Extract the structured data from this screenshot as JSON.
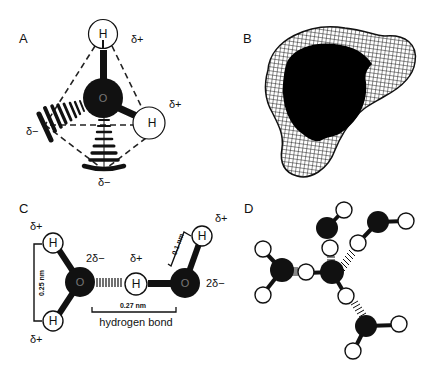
{
  "figure": {
    "panels": [
      {
        "id": "A",
        "label": "A",
        "description": "Tetrahedral water molecule with two hydrogens and two lone-pair charge lobes",
        "atoms": [
          {
            "symbol": "H",
            "role": "top-hydrogen",
            "charge": "δ+"
          },
          {
            "symbol": "O",
            "role": "oxygen"
          },
          {
            "symbol": "H",
            "role": "right-hydrogen",
            "charge": "δ+"
          }
        ],
        "lone_pairs": [
          {
            "role": "left-lone-pair",
            "charge": "δ−"
          },
          {
            "role": "bottom-lone-pair",
            "charge": "δ−"
          }
        ],
        "labels": {
          "h_top": "H",
          "o": "O",
          "h_right": "H",
          "delta_top": "δ+",
          "delta_right": "δ+",
          "delta_left": "δ−",
          "delta_bottom": "δ−"
        }
      },
      {
        "id": "B",
        "label": "B",
        "description": "Electron density wireframe surface of water molecule"
      },
      {
        "id": "C",
        "label": "C",
        "description": "Two water molecules linked by a hydrogen bond",
        "labels": {
          "h1": "H",
          "h2": "H",
          "o1": "O",
          "h3": "H",
          "o2": "O",
          "h4": "H",
          "delta_h1": "δ+",
          "delta_h2": "δ+",
          "delta_o1": "2δ−",
          "delta_h3": "δ+",
          "delta_o2": "2δ−",
          "delta_h4": "δ+",
          "dist_hh": "0.25 nm",
          "dist_oo": "0.27 nm",
          "dist_oh": "0.1 nm",
          "hbond_caption": "hydrogen bond"
        }
      },
      {
        "id": "D",
        "label": "D",
        "description": "Tetrahedral hydrogen-bonded cluster of five water molecules"
      }
    ],
    "colors": {
      "ink": "#111111",
      "background": "#ffffff",
      "dashed": "#222222"
    }
  }
}
